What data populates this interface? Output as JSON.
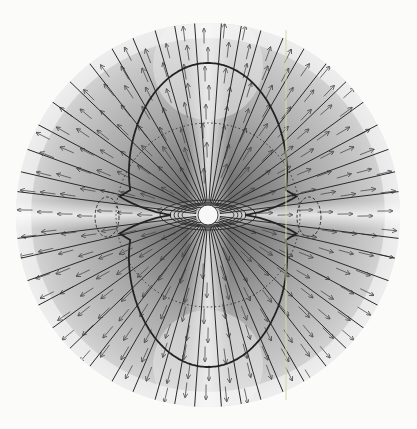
{
  "figure": {
    "width": 417,
    "height": 429,
    "background": "#fbfbfa",
    "center": [
      208,
      215
    ],
    "disk_radius": 192,
    "star_radius": 10,
    "colors": {
      "disk_light": "#e4e4e4",
      "disk_mid": "#bdbdbd",
      "disk_dark": "#6e6e6e",
      "field_line": "#2a2a2a",
      "arrow": "#4a4a4a",
      "star": "#f7f7f7",
      "scan_line": "#d8d6a8"
    },
    "field_line_angles_deg": [
      -86,
      -80,
      -74,
      -67,
      -60,
      -52,
      -44,
      -36,
      -28,
      -20,
      -13,
      -7,
      7,
      13,
      20,
      28,
      36,
      44,
      52,
      60,
      67,
      74,
      80,
      86,
      94,
      100,
      106,
      113,
      120,
      128,
      136,
      144,
      152,
      160,
      167,
      173,
      187,
      193,
      200,
      208,
      216,
      224,
      232,
      240,
      247,
      254,
      260,
      266
    ],
    "closed_loops": [
      {
        "rx": 16,
        "ry": 8
      },
      {
        "rx": 20,
        "ry": 10
      },
      {
        "rx": 24,
        "ry": 11
      },
      {
        "rx": 28,
        "ry": 12
      },
      {
        "rx": 38,
        "ry": 15
      }
    ],
    "dotted_circle_radius": 92,
    "peanut_scale": 152,
    "dashed_equator_ellipses": [
      {
        "cx": 107,
        "cy": 217,
        "rx": 12,
        "ry": 20
      },
      {
        "cx": 309,
        "cy": 217,
        "rx": 12,
        "ry": 20
      }
    ],
    "arrow_grid_step": 20,
    "arrow_length": 15,
    "scan_line_x": 286
  }
}
